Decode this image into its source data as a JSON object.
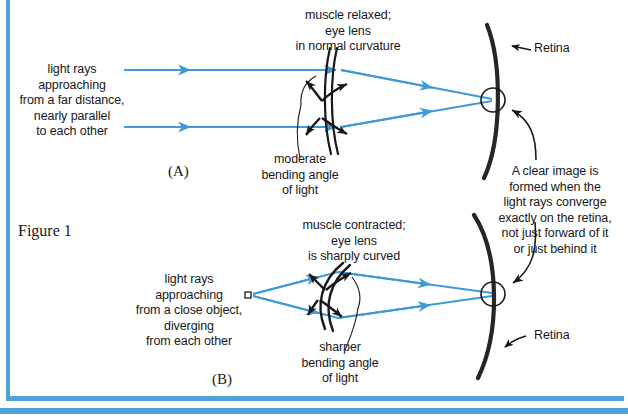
{
  "figure": {
    "caption": "Figure 1",
    "accent_color": "#4ea3d8",
    "ray_color": "#3f9ad6",
    "ink_color": "#18181a",
    "background": "#ffffff"
  },
  "panels": [
    {
      "id": "A",
      "label": "(A)",
      "source_label": "light rays\napproaching\nfrom a far distance,\nnearly parallel\nto each other",
      "lens_label": "muscle relaxed;\neye lens\nin normal curvature",
      "bending_label": "moderate\nbending angle\nof light",
      "retina_label": "Retina",
      "focus_label": "A clear image is\nformed when the\nlight rays converge\nexactly on the retina,\nnot just forward of it\nor just behind it"
    },
    {
      "id": "B",
      "label": "(B)",
      "source_label": "light rays\napproaching\nfrom a close object,\ndiverging\nfrom each other",
      "lens_label": "muscle contracted;\neye lens\nis sharply curved",
      "bending_label": "sharper\nbending angle\nof light",
      "retina_label": "Retina",
      "focus_label": ""
    }
  ],
  "icons": {
    "ray_arrow": "ray-arrowhead",
    "leader_arrow": "leader-arrowhead",
    "source_point": "point-source-marker",
    "focus_circle": "focus-point-circle"
  }
}
